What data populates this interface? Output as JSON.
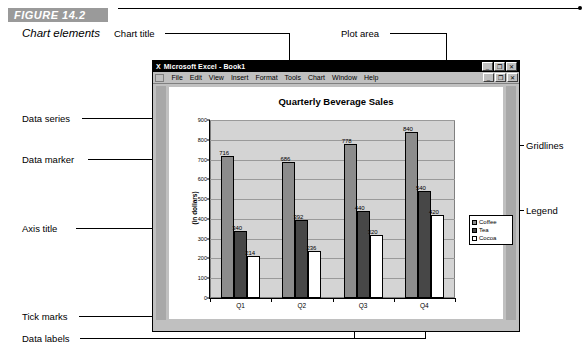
{
  "figure": {
    "number": "FIGURE 14.2",
    "caption": "Chart elements"
  },
  "callouts": {
    "chart_title": "Chart title",
    "plot_area": "Plot area",
    "data_series": "Data series",
    "data_marker": "Data marker",
    "axis_title": "Axis title",
    "tick_marks": "Tick marks",
    "data_labels": "Data labels",
    "gridlines": "Gridlines",
    "legend": "Legend"
  },
  "window": {
    "app_icon": "X",
    "title": "Microsoft Excel - Book1",
    "window_buttons": [
      "_",
      "❐",
      "✕"
    ],
    "doc_buttons": [
      "_",
      "❐",
      "✕"
    ],
    "menu": [
      "File",
      "Edit",
      "View",
      "Insert",
      "Format",
      "Tools",
      "Chart",
      "Window",
      "Help"
    ]
  },
  "colors": {
    "coffee": "#8c8c8c",
    "tea": "#474747",
    "cocoa": "#ffffff",
    "plot_area": "#d4d4d4",
    "gridline": "#9a9a9a",
    "window_chrome": "#c0c0c0",
    "figure_bar": "#9a9a9a"
  },
  "chart_data": {
    "type": "bar",
    "title": "Quarterly Beverage Sales",
    "xlabel": "",
    "ylabel": "(in dollars)",
    "categories": [
      "Q1",
      "Q2",
      "Q3",
      "Q4"
    ],
    "series": [
      {
        "name": "Coffee",
        "values": [
          716,
          686,
          778,
          840
        ]
      },
      {
        "name": "Tea",
        "values": [
          340,
          392,
          440,
          540
        ]
      },
      {
        "name": "Cocoa",
        "values": [
          214,
          236,
          320,
          420
        ]
      }
    ],
    "ylim": [
      0,
      900
    ],
    "yticks": [
      0,
      100,
      200,
      300,
      400,
      500,
      600,
      700,
      800,
      900
    ],
    "grid": true,
    "data_labels": true,
    "legend_position": "right"
  }
}
